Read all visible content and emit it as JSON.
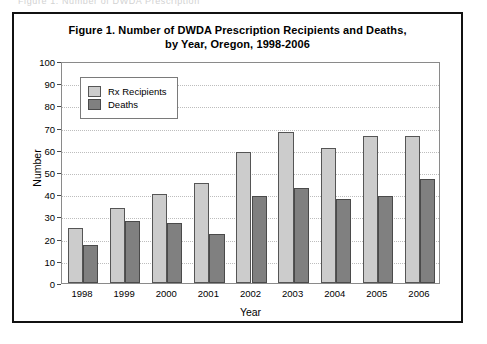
{
  "scan": {
    "top_artifact_text": "Figure 1.  Number of DWDA Prescription"
  },
  "figure": {
    "title_line1": "Figure 1.  Number of DWDA Prescription Recipients and Deaths,",
    "title_line2": "by Year, Oregon, 1998-2006"
  },
  "colors": {
    "rx_fill": "#cccccc",
    "deaths_fill": "#808080",
    "bar_outline": "#555555",
    "gridline": "#bdbdbd",
    "frame": "#111111",
    "text": "#000000"
  },
  "chart_data": {
    "type": "bar",
    "title": "Figure 1.  Number of DWDA Prescription Recipients and Deaths, by Year, Oregon, 1998-2006",
    "xlabel": "Year",
    "ylabel": "Number",
    "categories": [
      "1998",
      "1999",
      "2000",
      "2001",
      "2002",
      "2003",
      "2004",
      "2005",
      "2006"
    ],
    "series": [
      {
        "name": "Rx Recipients",
        "values": [
          25,
          34,
          40,
          45,
          59,
          68,
          61,
          66,
          66
        ]
      },
      {
        "name": "Deaths",
        "values": [
          17,
          28,
          27,
          22,
          39,
          43,
          38,
          39,
          47
        ]
      }
    ],
    "ylim": [
      0,
      100
    ],
    "yticks": [
      0,
      10,
      20,
      30,
      40,
      50,
      60,
      70,
      80,
      90,
      100
    ],
    "ytick_labels": [
      "0",
      "10",
      "20",
      "30",
      "40",
      "50",
      "60",
      "70",
      "80",
      "90",
      "100"
    ],
    "grid": true,
    "legend_position": "top-left",
    "legend_entries": [
      "Rx Recipients",
      "Deaths"
    ]
  }
}
